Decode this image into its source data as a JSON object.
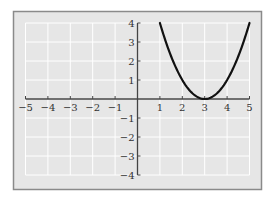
{
  "chart_data": {
    "type": "line",
    "title": "",
    "xlabel": "",
    "ylabel": "",
    "function": "y = (x - 3)^2",
    "xlim": [
      -5,
      5
    ],
    "ylim": [
      -4,
      4
    ],
    "grid": true,
    "x_ticks": [
      -5,
      -4,
      -3,
      -2,
      -1,
      1,
      2,
      3,
      4,
      5
    ],
    "y_ticks": [
      -4,
      -3,
      -2,
      -1,
      1,
      2,
      3,
      4
    ],
    "x_tick_labels": [
      "−5",
      "−4",
      "−3",
      "−2",
      "−1",
      "1",
      "2",
      "3",
      "4",
      "5"
    ],
    "y_tick_labels": [
      "−4",
      "−3",
      "−2",
      "−1",
      "1",
      "2",
      "3",
      "4"
    ],
    "series": [
      {
        "name": "parabola",
        "color": "#111111",
        "x": [
          1,
          1.5,
          2,
          2.5,
          3,
          3.5,
          4,
          4.5,
          5
        ],
        "y": [
          4,
          2.25,
          1,
          0.25,
          0,
          0.25,
          1,
          2.25,
          4
        ]
      }
    ]
  },
  "colors": {
    "frame_border": "#8a8a8a",
    "plot_background": "#e6e6e6",
    "grid_line": "#ffffff",
    "axis": "#444444",
    "curve": "#111111"
  }
}
